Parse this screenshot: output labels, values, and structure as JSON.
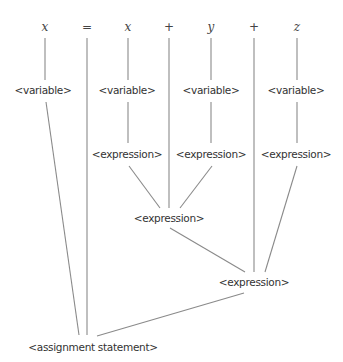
{
  "diagram": {
    "type": "parse-tree",
    "line_color": "#8a8a8a",
    "tokens": [
      {
        "text": "x",
        "x": 45,
        "y": 27,
        "kind": "var"
      },
      {
        "text": "=",
        "x": 87,
        "y": 27,
        "kind": "op"
      },
      {
        "text": "x",
        "x": 128,
        "y": 27,
        "kind": "var"
      },
      {
        "text": "+",
        "x": 169,
        "y": 27,
        "kind": "op"
      },
      {
        "text": "y",
        "x": 211,
        "y": 27,
        "kind": "var"
      },
      {
        "text": "+",
        "x": 254,
        "y": 27,
        "kind": "op"
      },
      {
        "text": "z",
        "x": 297,
        "y": 27,
        "kind": "var"
      }
    ],
    "nodes": [
      {
        "text": "<variable>",
        "x": 43,
        "y": 90
      },
      {
        "text": "<variable>",
        "x": 127,
        "y": 90
      },
      {
        "text": "<variable>",
        "x": 211,
        "y": 90
      },
      {
        "text": "<variable>",
        "x": 296,
        "y": 90
      },
      {
        "text": "<expression>",
        "x": 127,
        "y": 154
      },
      {
        "text": "<expression>",
        "x": 211,
        "y": 154
      },
      {
        "text": "<expression>",
        "x": 296,
        "y": 154
      },
      {
        "text": "<expression>",
        "x": 169,
        "y": 218
      },
      {
        "text": "<expression>",
        "x": 254,
        "y": 282
      },
      {
        "text": "<assignment statement>",
        "x": 93,
        "y": 347
      }
    ],
    "edges": [
      [
        45,
        38,
        45,
        80
      ],
      [
        128,
        38,
        128,
        80
      ],
      [
        211,
        38,
        211,
        80
      ],
      [
        297,
        38,
        297,
        80
      ],
      [
        87,
        38,
        87,
        335
      ],
      [
        169,
        38,
        169,
        208
      ],
      [
        254,
        38,
        254,
        272
      ],
      [
        46,
        102,
        79,
        335
      ],
      [
        128,
        102,
        128,
        143
      ],
      [
        211,
        102,
        211,
        143
      ],
      [
        297,
        102,
        297,
        143
      ],
      [
        129,
        166,
        160,
        208
      ],
      [
        212,
        166,
        180,
        208
      ],
      [
        297,
        166,
        265,
        272
      ],
      [
        170,
        228,
        245,
        272
      ],
      [
        244,
        293,
        97,
        336
      ]
    ]
  }
}
